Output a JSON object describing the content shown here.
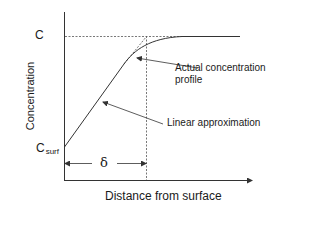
{
  "diagram": {
    "y_axis_label": "Concentration",
    "x_axis_label": "Distance from surface",
    "c_label": "C",
    "csurf_label_main": "C",
    "csurf_label_sub": "surf",
    "delta_label": "δ",
    "annotations": {
      "actual": "Actual concentration profile",
      "linear": "Linear approximation"
    },
    "colors": {
      "line": "#333333",
      "text": "#1a1a1a",
      "background": "#ffffff"
    }
  }
}
